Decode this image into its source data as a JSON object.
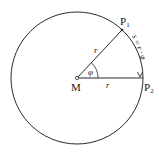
{
  "diagram": {
    "type": "circle-arc-length",
    "center": {
      "label": "M",
      "x": 77,
      "y": 78
    },
    "radius_px": 66,
    "points": [
      {
        "id": "P1",
        "label": "P",
        "sub": "1",
        "x": 122,
        "y": 30
      },
      {
        "id": "P2",
        "label": "P",
        "sub": "2",
        "x": 143,
        "y": 78
      }
    ],
    "radius_labels": [
      "r",
      "r"
    ],
    "angle_label": "φ",
    "arc_formula": "s = r · φ",
    "colors": {
      "stroke": "#2a2a2a",
      "background": "#ffffff"
    }
  }
}
